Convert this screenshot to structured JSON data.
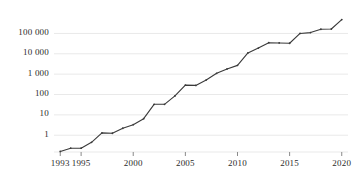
{
  "chart_data": {
    "type": "line",
    "title": "",
    "subtitle": "",
    "xlabel": "",
    "ylabel": "",
    "yscale": "log",
    "xlim": [
      1992.4,
      2020.6
    ],
    "ylim": [
      0.15,
      900000
    ],
    "grid": true,
    "grid_axis": "y",
    "legend": false,
    "legend_position": "none",
    "line_color": "#3a3a3a",
    "grid_color": "#e9e9e9",
    "axis_color": "#8a8a8a",
    "marker": "dot",
    "x": [
      1993,
      1994,
      1995,
      1996,
      1997,
      1998,
      1999,
      2000,
      2001,
      2002,
      2003,
      2004,
      2005,
      2006,
      2007,
      2008,
      2009,
      2010,
      2011,
      2012,
      2013,
      2014,
      2015,
      2016,
      2017,
      2018,
      2019,
      2020
    ],
    "values": [
      0.16,
      0.23,
      0.23,
      0.45,
      1.3,
      1.25,
      2.2,
      3.3,
      6.5,
      33,
      33,
      85,
      290,
      280,
      520,
      1100,
      1800,
      2700,
      11000,
      19000,
      35000,
      34000,
      33000,
      100000,
      110000,
      160000,
      165000,
      480000
    ],
    "xticks": [
      1993,
      1995,
      2000,
      2005,
      2010,
      2015,
      2020
    ],
    "xtick_labels": [
      "1993",
      "1995",
      "2000",
      "2005",
      "2010",
      "2015",
      "2020"
    ],
    "yticks": [
      1,
      10,
      100,
      1000,
      10000,
      100000
    ],
    "ytick_labels": [
      "1",
      "10",
      "100",
      "1 000",
      "10 000",
      "100 000"
    ]
  }
}
